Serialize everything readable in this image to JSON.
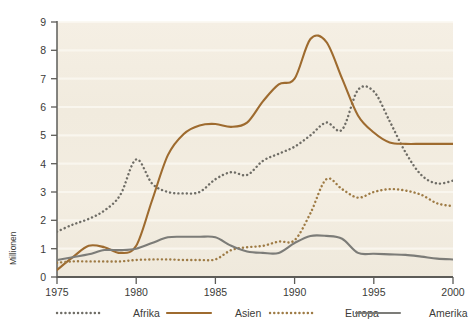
{
  "chart_data": {
    "type": "line",
    "title": "",
    "xlabel": "",
    "ylabel": "Millionen",
    "xlim": [
      1975,
      2000
    ],
    "ylim": [
      0,
      9
    ],
    "xticks": [
      "1975",
      "1980",
      "1985",
      "1990",
      "1995",
      "2000"
    ],
    "yticks": [
      "0",
      "1",
      "2",
      "3",
      "4",
      "5",
      "6",
      "7",
      "8",
      "9"
    ],
    "grid": "horizontal",
    "legend_position": "bottom",
    "x": [
      1975,
      1976,
      1977,
      1978,
      1979,
      1980,
      1981,
      1982,
      1983,
      1984,
      1985,
      1986,
      1987,
      1988,
      1989,
      1990,
      1991,
      1992,
      1993,
      1994,
      1995,
      1996,
      1997,
      1998,
      1999,
      2000
    ],
    "series": [
      {
        "name": "Afrika",
        "color": "#6f6d66",
        "style": "dotted",
        "values": [
          1.6,
          1.85,
          2.05,
          2.35,
          2.9,
          4.15,
          3.3,
          3.0,
          2.95,
          3.0,
          3.45,
          3.7,
          3.6,
          4.1,
          4.35,
          4.6,
          5.0,
          5.45,
          5.2,
          6.6,
          6.55,
          5.5,
          4.4,
          3.6,
          3.3,
          3.4
        ],
        "annotations": [
          "peak 4.15 at 1980",
          "peak 6.6 at 1994"
        ]
      },
      {
        "name": "Asien",
        "color": "#9e6b2f",
        "style": "solid",
        "values": [
          0.25,
          0.7,
          1.1,
          1.05,
          0.85,
          1.1,
          2.7,
          4.3,
          5.05,
          5.35,
          5.4,
          5.3,
          5.45,
          6.2,
          6.8,
          7.0,
          8.4,
          8.3,
          7.0,
          5.7,
          5.1,
          4.75,
          4.7,
          4.7,
          4.7,
          4.7
        ],
        "annotations": [
          "peak 8.4 at 1991"
        ]
      },
      {
        "name": "Europa",
        "color": "#9e7b45",
        "style": "dotted",
        "values": [
          0.5,
          0.55,
          0.55,
          0.55,
          0.55,
          0.6,
          0.62,
          0.62,
          0.6,
          0.6,
          0.62,
          0.95,
          1.05,
          1.1,
          1.25,
          1.3,
          2.25,
          3.45,
          3.1,
          2.8,
          3.0,
          3.1,
          3.05,
          2.9,
          2.6,
          2.5
        ],
        "annotations": [
          "peak 3.45 at 1992"
        ]
      },
      {
        "name": "Amerika",
        "color": "#7c7c78",
        "style": "solid",
        "values": [
          0.6,
          0.7,
          0.8,
          0.95,
          0.95,
          1.0,
          1.2,
          1.4,
          1.42,
          1.42,
          1.4,
          1.1,
          0.9,
          0.85,
          0.85,
          1.2,
          1.45,
          1.45,
          1.35,
          0.85,
          0.82,
          0.8,
          0.78,
          0.72,
          0.65,
          0.62
        ],
        "annotations": [
          "plateau 1.42 around 1983-1985"
        ]
      }
    ]
  },
  "axis": {
    "y_title": "Millionen",
    "y_ticks": [
      "9",
      "8",
      "7",
      "6",
      "5",
      "4",
      "3",
      "2",
      "1",
      "0"
    ],
    "x_ticks": [
      "1975",
      "1980",
      "1985",
      "1990",
      "1995",
      "2000"
    ]
  },
  "legend": {
    "items": [
      {
        "label": "Afrika",
        "color": "#6f6d66",
        "style": "dotted"
      },
      {
        "label": "Asien",
        "color": "#9e6b2f",
        "style": "solid"
      },
      {
        "label": "Europa",
        "color": "#9e7b45",
        "style": "dotted"
      },
      {
        "label": "Amerika",
        "color": "#7c7c78",
        "style": "solid"
      }
    ]
  },
  "colors": {
    "plot_background": "#f2ece0",
    "page_background": "#ffffff",
    "axis": "#5d5c58",
    "gridline": "#faf6ee",
    "text": "#3b3b38"
  }
}
